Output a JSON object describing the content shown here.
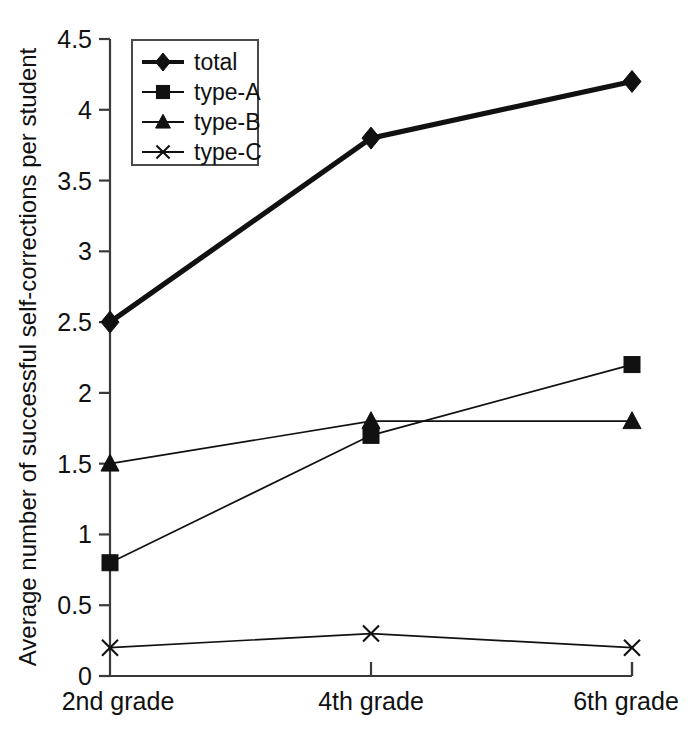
{
  "chart_data": {
    "type": "line",
    "title": "",
    "subtitle": "",
    "xlabel": "",
    "ylabel": "Average number of successful self-corrections per student",
    "categories": [
      "2nd grade",
      "4th grade",
      "6th grade"
    ],
    "ylim": [
      0,
      4.5
    ],
    "yticks": [
      "0",
      "0.5",
      "1",
      "1.5",
      "2",
      "2.5",
      "3",
      "3.5",
      "4",
      "4.5"
    ],
    "ytick_values": [
      0,
      0.5,
      1,
      1.5,
      2,
      2.5,
      3,
      3.5,
      4,
      4.5
    ],
    "grid": false,
    "legend_position": "top-left",
    "series": [
      {
        "name": "total",
        "marker": "diamond",
        "values": [
          2.5,
          3.8,
          4.2
        ]
      },
      {
        "name": "type-A",
        "marker": "square",
        "values": [
          0.8,
          1.7,
          2.2
        ]
      },
      {
        "name": "type-B",
        "marker": "triangle",
        "values": [
          1.5,
          1.8,
          1.8
        ]
      },
      {
        "name": "type-C",
        "marker": "cross",
        "values": [
          0.2,
          0.3,
          0.2
        ]
      }
    ],
    "colors": {
      "series": "#111111",
      "axis": "#3a3a3a",
      "background": "#ffffff",
      "legend_border": "#4a4a4a"
    }
  }
}
